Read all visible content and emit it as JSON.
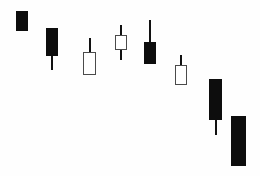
{
  "chart_data": {
    "type": "candlestick",
    "title": "",
    "subtitle": "",
    "xlabel": "",
    "ylabel": "",
    "grid": false,
    "axes_visible": false,
    "legend": "none",
    "background_color": "#fefefe",
    "bearish_color": "#0d0d0d",
    "bullish_color": "#ffffff",
    "bullish_border_color": "#4a4a4a",
    "wick_color": "#111111",
    "y_axis_note": "price increases upward; pixel y is inverted",
    "ylim_px": [
      0,
      176
    ],
    "xlim_px": [
      0,
      260
    ],
    "categories": [
      "1",
      "2",
      "3",
      "4",
      "5",
      "6",
      "7",
      "8"
    ],
    "candles": [
      {
        "index": 1,
        "direction": "bearish",
        "x_left": 16,
        "x_right": 28,
        "width": 12,
        "body_top": 11,
        "body_bottom": 31,
        "wick_top": 11,
        "wick_bottom": 31,
        "open_px": 11,
        "close_px": 31,
        "high_px": 11,
        "low_px": 31
      },
      {
        "index": 2,
        "direction": "bearish",
        "x_left": 46,
        "x_right": 58,
        "width": 12,
        "body_top": 28,
        "body_bottom": 56,
        "wick_top": 28,
        "wick_bottom": 70,
        "open_px": 28,
        "close_px": 56,
        "high_px": 28,
        "low_px": 70
      },
      {
        "index": 3,
        "direction": "bullish",
        "x_left": 83,
        "x_right": 96,
        "width": 13,
        "body_top": 52,
        "body_bottom": 75,
        "wick_top": 38,
        "wick_bottom": 75,
        "open_px": 75,
        "close_px": 52,
        "high_px": 38,
        "low_px": 75
      },
      {
        "index": 4,
        "direction": "bullish",
        "x_left": 115,
        "x_right": 127,
        "width": 12,
        "body_top": 35,
        "body_bottom": 50,
        "wick_top": 25,
        "wick_bottom": 60,
        "open_px": 50,
        "close_px": 35,
        "high_px": 25,
        "low_px": 60
      },
      {
        "index": 5,
        "direction": "bearish",
        "x_left": 144,
        "x_right": 156,
        "width": 12,
        "body_top": 42,
        "body_bottom": 64,
        "wick_top": 20,
        "wick_bottom": 64,
        "open_px": 42,
        "close_px": 64,
        "high_px": 20,
        "low_px": 64
      },
      {
        "index": 6,
        "direction": "bullish",
        "x_left": 175,
        "x_right": 187,
        "width": 12,
        "body_top": 65,
        "body_bottom": 85,
        "wick_top": 55,
        "wick_bottom": 85,
        "open_px": 85,
        "close_px": 65,
        "high_px": 55,
        "low_px": 85
      },
      {
        "index": 7,
        "direction": "bearish",
        "x_left": 209,
        "x_right": 222,
        "width": 13,
        "body_top": 79,
        "body_bottom": 120,
        "wick_top": 79,
        "wick_bottom": 135,
        "open_px": 79,
        "close_px": 120,
        "high_px": 79,
        "low_px": 135
      },
      {
        "index": 8,
        "direction": "bearish",
        "x_left": 231,
        "x_right": 246,
        "width": 15,
        "body_top": 116,
        "body_bottom": 166,
        "wick_top": 116,
        "wick_bottom": 166,
        "open_px": 116,
        "close_px": 166,
        "high_px": 116,
        "low_px": 166
      }
    ]
  }
}
